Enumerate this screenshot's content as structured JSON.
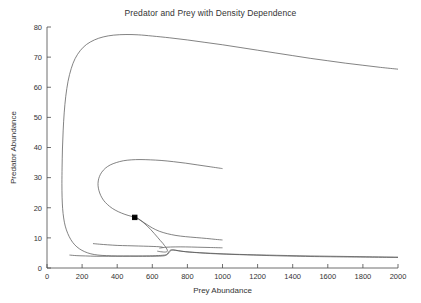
{
  "figure": {
    "width": 421,
    "height": 303,
    "background": "#ffffff",
    "line_color": "#5a5a5a",
    "axis_color": "#4a4a4a",
    "text_color": "#333333"
  },
  "chart_data": {
    "type": "line",
    "title": "Predator and Prey with Density Dependence",
    "xlabel": "Prey Abundance",
    "ylabel": "Predator Abundance",
    "xlim": [
      0,
      2000
    ],
    "ylim": [
      0,
      80
    ],
    "xticks": [
      0,
      200,
      400,
      600,
      800,
      1000,
      1200,
      1400,
      1600,
      1800,
      2000
    ],
    "yticks": [
      0,
      10,
      20,
      30,
      40,
      50,
      60,
      70,
      80
    ],
    "grid": false,
    "legend": null,
    "annotations": [
      {
        "name": "equilibrium-point",
        "marker": "filled-square",
        "x": 500,
        "y": 16.8
      }
    ],
    "series": [
      {
        "name": "outer-trajectory",
        "points": [
          [
            2000,
            66.0
          ],
          [
            1900,
            66.6
          ],
          [
            1800,
            67.3
          ],
          [
            1700,
            68.0
          ],
          [
            1600,
            68.8
          ],
          [
            1500,
            69.6
          ],
          [
            1400,
            70.5
          ],
          [
            1300,
            71.4
          ],
          [
            1200,
            72.3
          ],
          [
            1100,
            73.2
          ],
          [
            1000,
            74.1
          ],
          [
            900,
            74.9
          ],
          [
            800,
            75.7
          ],
          [
            700,
            76.4
          ],
          [
            600,
            77.0
          ],
          [
            520,
            77.4
          ],
          [
            450,
            77.5
          ],
          [
            380,
            77.3
          ],
          [
            320,
            76.7
          ],
          [
            270,
            75.7
          ],
          [
            225,
            74.2
          ],
          [
            190,
            72.2
          ],
          [
            160,
            69.5
          ],
          [
            138,
            66.2
          ],
          [
            120,
            62.0
          ],
          [
            107,
            57.0
          ],
          [
            98,
            51.5
          ],
          [
            92,
            45.5
          ],
          [
            88,
            39.5
          ],
          [
            86,
            33.5
          ],
          [
            85,
            28.0
          ],
          [
            86,
            23.5
          ],
          [
            89,
            19.8
          ],
          [
            95,
            16.6
          ],
          [
            104,
            13.9
          ],
          [
            118,
            11.5
          ],
          [
            136,
            9.4
          ],
          [
            158,
            7.7
          ],
          [
            184,
            6.4
          ],
          [
            215,
            5.4
          ],
          [
            250,
            4.7
          ],
          [
            290,
            4.3
          ],
          [
            340,
            4.1
          ],
          [
            400,
            4.0
          ],
          [
            470,
            4.0
          ],
          [
            545,
            4.0
          ],
          [
            620,
            4.1
          ],
          [
            670,
            4.3
          ],
          [
            690,
            4.7
          ],
          [
            700,
            5.5
          ],
          [
            720,
            6.0
          ],
          [
            790,
            5.4
          ],
          [
            900,
            5.0
          ],
          [
            1050,
            4.6
          ],
          [
            1250,
            4.3
          ],
          [
            1500,
            4.0
          ],
          [
            1750,
            3.8
          ],
          [
            2000,
            3.6
          ]
        ]
      },
      {
        "name": "inner-trajectory",
        "points": [
          [
            1000,
            33.0
          ],
          [
            930,
            33.6
          ],
          [
            860,
            34.2
          ],
          [
            790,
            34.8
          ],
          [
            720,
            35.3
          ],
          [
            650,
            35.7
          ],
          [
            590,
            35.9
          ],
          [
            530,
            36.0
          ],
          [
            480,
            35.9
          ],
          [
            435,
            35.6
          ],
          [
            395,
            35.0
          ],
          [
            360,
            34.2
          ],
          [
            332,
            33.1
          ],
          [
            312,
            31.8
          ],
          [
            299,
            30.4
          ],
          [
            292,
            28.9
          ],
          [
            291,
            27.3
          ],
          [
            296,
            25.7
          ],
          [
            306,
            24.1
          ],
          [
            322,
            22.5
          ],
          [
            344,
            21.1
          ],
          [
            372,
            19.8
          ],
          [
            406,
            18.7
          ],
          [
            444,
            17.8
          ],
          [
            478,
            17.2
          ],
          [
            500,
            16.9
          ],
          [
            520,
            16.4
          ],
          [
            545,
            15.3
          ],
          [
            570,
            14.0
          ],
          [
            592,
            12.7
          ],
          [
            612,
            11.4
          ],
          [
            630,
            10.2
          ],
          [
            646,
            9.1
          ],
          [
            660,
            8.2
          ],
          [
            670,
            7.4
          ],
          [
            678,
            6.8
          ],
          [
            683,
            6.3
          ],
          [
            686,
            5.9
          ],
          [
            686,
            5.6
          ],
          [
            683,
            5.4
          ],
          [
            676,
            5.3
          ],
          [
            664,
            5.3
          ],
          [
            648,
            5.4
          ],
          [
            628,
            5.6
          ]
        ]
      },
      {
        "name": "upper-inflow-trajectory",
        "points": [
          [
            500,
            16.9
          ],
          [
            530,
            15.9
          ],
          [
            565,
            14.6
          ],
          [
            600,
            13.3
          ],
          [
            640,
            12.2
          ],
          [
            685,
            11.4
          ],
          [
            735,
            10.8
          ],
          [
            790,
            10.4
          ],
          [
            850,
            10.1
          ],
          [
            910,
            9.8
          ],
          [
            960,
            9.5
          ],
          [
            1000,
            9.3
          ]
        ]
      },
      {
        "name": "lower-left-trajectory",
        "points": [
          [
            262,
            8.1
          ],
          [
            300,
            7.9
          ],
          [
            345,
            7.7
          ],
          [
            400,
            7.5
          ],
          [
            460,
            7.4
          ],
          [
            520,
            7.3
          ],
          [
            580,
            7.2
          ],
          [
            625,
            7.1
          ],
          [
            650,
            7.0
          ],
          [
            662,
            6.8
          ]
        ]
      },
      {
        "name": "lower-right-trajectory",
        "points": [
          [
            640,
            6.6
          ],
          [
            680,
            6.9
          ],
          [
            730,
            7.0
          ],
          [
            790,
            7.0
          ],
          [
            860,
            6.9
          ],
          [
            930,
            6.8
          ],
          [
            1000,
            6.7
          ]
        ]
      },
      {
        "name": "basal-trajectory",
        "points": [
          [
            128,
            4.3
          ],
          [
            170,
            4.1
          ],
          [
            220,
            4.0
          ],
          [
            280,
            3.9
          ],
          [
            350,
            3.9
          ],
          [
            430,
            3.9
          ],
          [
            520,
            3.9
          ],
          [
            610,
            3.9
          ],
          [
            660,
            4.0
          ],
          [
            680,
            4.3
          ],
          [
            690,
            5.0
          ],
          [
            700,
            5.8
          ],
          [
            715,
            6.0
          ],
          [
            760,
            5.6
          ],
          [
            830,
            5.2
          ],
          [
            930,
            4.8
          ],
          [
            1060,
            4.5
          ],
          [
            1220,
            4.2
          ],
          [
            1420,
            3.9
          ],
          [
            1650,
            3.7
          ],
          [
            2000,
            3.5
          ]
        ]
      }
    ]
  }
}
